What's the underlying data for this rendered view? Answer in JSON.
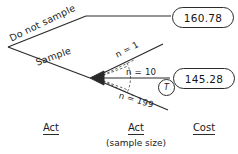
{
  "diagram": {
    "ink_color": "#2a2a2a",
    "background": "#ffffff",
    "branches": {
      "do_not_sample_label": "Do not sample",
      "sample_label": "Sample"
    },
    "fan": {
      "n_min_label": "n = 1",
      "n_mid_label": "n = 10",
      "n_max_label": "n = 199",
      "marker_label": "T"
    },
    "values": {
      "cost_do_not_sample": "160.78",
      "cost_sample": "145.28"
    },
    "columns": {
      "act": "Act",
      "act_sample_size": "Act",
      "act_sample_size_sub": "(sample size)",
      "cost": "Cost"
    }
  }
}
